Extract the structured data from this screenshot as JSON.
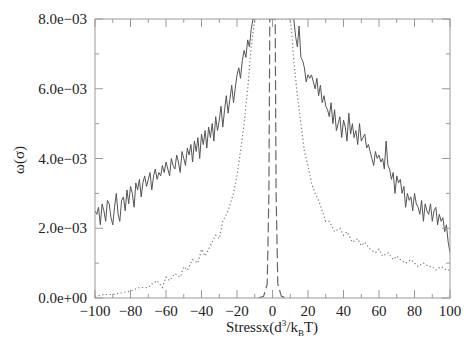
{
  "chart_data": {
    "type": "line",
    "title": "",
    "xlabel": "Stressx(d^3/k_B T)",
    "xlabel_parts": {
      "main": "Stressx(d",
      "sup": "3",
      "mid": "/k",
      "sub": "B",
      "end": "T)"
    },
    "ylabel": "ω(σ)",
    "xlim": [
      -100,
      100
    ],
    "ylim": [
      0,
      0.008
    ],
    "xticks": [
      -100,
      -80,
      -60,
      -40,
      -20,
      0,
      20,
      40,
      60,
      80,
      100
    ],
    "xtick_labels": [
      "−100",
      "−80",
      "−60",
      "−40",
      "−20",
      "0",
      "20",
      "40",
      "60",
      "80",
      "100"
    ],
    "yticks": [
      0,
      0.002,
      0.004,
      0.006,
      0.008
    ],
    "ytick_labels": [
      "0.0e+00",
      "2.0e−03",
      "4.0e−03",
      "6.0e−03",
      "8.0e−03"
    ],
    "grid": false,
    "legend": null,
    "series": [
      {
        "name": "solid",
        "style": "solid",
        "color": "#555555",
        "x": [
          -100,
          -99,
          -98,
          -97,
          -96,
          -95,
          -94,
          -93,
          -92,
          -91,
          -90,
          -89,
          -88,
          -87,
          -86,
          -85,
          -84,
          -83,
          -82,
          -81,
          -80,
          -79,
          -78,
          -77,
          -76,
          -75,
          -74,
          -73,
          -72,
          -71,
          -70,
          -69,
          -68,
          -67,
          -66,
          -65,
          -64,
          -63,
          -62,
          -61,
          -60,
          -59,
          -58,
          -57,
          -56,
          -55,
          -54,
          -53,
          -52,
          -51,
          -50,
          -49,
          -48,
          -47,
          -46,
          -45,
          -44,
          -43,
          -42,
          -41,
          -40,
          -39,
          -38,
          -37,
          -36,
          -35,
          -34,
          -33,
          -32,
          -31,
          -30,
          -29,
          -28,
          -27,
          -26,
          -25,
          -24,
          -23,
          -22,
          -21,
          -20,
          -19,
          -18,
          -17,
          -16,
          -15,
          -14,
          -13,
          -12,
          -11,
          -10
        ],
        "y": [
          0.0025,
          0.0024,
          0.0026,
          0.0021,
          0.0027,
          0.0025,
          0.0022,
          0.0028,
          0.0027,
          0.0023,
          0.0021,
          0.0026,
          0.003,
          0.0024,
          0.0022,
          0.0028,
          0.0029,
          0.0025,
          0.0031,
          0.0027,
          0.0032,
          0.003,
          0.0026,
          0.0033,
          0.0031,
          0.0034,
          0.0029,
          0.0033,
          0.0035,
          0.0032,
          0.0034,
          0.0036,
          0.0031,
          0.0035,
          0.0037,
          0.0034,
          0.0036,
          0.0035,
          0.0038,
          0.0036,
          0.0039,
          0.0037,
          0.0035,
          0.004,
          0.0038,
          0.0037,
          0.0041,
          0.0039,
          0.0036,
          0.0042,
          0.004,
          0.0038,
          0.0043,
          0.0041,
          0.0044,
          0.0039,
          0.0045,
          0.0042,
          0.0046,
          0.004,
          0.0047,
          0.0044,
          0.0048,
          0.0043,
          0.0049,
          0.0046,
          0.005,
          0.0045,
          0.0052,
          0.0048,
          0.0051,
          0.0055,
          0.0049,
          0.0054,
          0.0058,
          0.0053,
          0.0057,
          0.0061,
          0.0056,
          0.006,
          0.0064,
          0.0066,
          0.0063,
          0.0068,
          0.0071,
          0.0069,
          0.0074,
          0.0072,
          0.0077,
          0.008,
          0.008
        ]
      },
      {
        "name": "solid-right",
        "style": "solid",
        "color": "#555555",
        "x": [
          12,
          13,
          14,
          15,
          16,
          17,
          18,
          19,
          20,
          21,
          22,
          23,
          24,
          25,
          26,
          27,
          28,
          29,
          30,
          31,
          32,
          33,
          34,
          35,
          36,
          37,
          38,
          39,
          40,
          41,
          42,
          43,
          44,
          45,
          46,
          47,
          48,
          49,
          50,
          51,
          52,
          53,
          54,
          55,
          56,
          57,
          58,
          59,
          60,
          61,
          62,
          63,
          64,
          65,
          66,
          67,
          68,
          69,
          70,
          71,
          72,
          73,
          74,
          75,
          76,
          77,
          78,
          79,
          80,
          81,
          82,
          83,
          84,
          85,
          86,
          87,
          88,
          89,
          90,
          91,
          92,
          93,
          94,
          95,
          96,
          97,
          98,
          99,
          100
        ],
        "y": [
          0.008,
          0.0075,
          0.0072,
          0.0078,
          0.0069,
          0.0068,
          0.0066,
          0.0062,
          0.0064,
          0.0063,
          0.0064,
          0.0062,
          0.006,
          0.0063,
          0.0058,
          0.0061,
          0.0056,
          0.0058,
          0.0055,
          0.0054,
          0.0052,
          0.0056,
          0.005,
          0.0054,
          0.0048,
          0.005,
          0.0052,
          0.0046,
          0.0051,
          0.0049,
          0.0045,
          0.0053,
          0.0047,
          0.005,
          0.0046,
          0.0048,
          0.0044,
          0.005,
          0.0045,
          0.0046,
          0.0047,
          0.0043,
          0.0044,
          0.0042,
          0.004,
          0.0038,
          0.0042,
          0.004,
          0.0041,
          0.0039,
          0.004,
          0.0037,
          0.0045,
          0.0038,
          0.0037,
          0.0034,
          0.0036,
          0.003,
          0.0035,
          0.0033,
          0.0034,
          0.003,
          0.0032,
          0.0026,
          0.003,
          0.0028,
          0.0029,
          0.0025,
          0.003,
          0.0027,
          0.0026,
          0.0024,
          0.0028,
          0.0022,
          0.0027,
          0.0025,
          0.0024,
          0.0027,
          0.0022,
          0.0025,
          0.0026,
          0.0021,
          0.0024,
          0.0022,
          0.0023,
          0.0019,
          0.0021,
          0.0016,
          0.0013
        ]
      },
      {
        "name": "dotted",
        "style": "dotted",
        "color": "#777777",
        "x": [
          -100,
          -95,
          -90,
          -85,
          -80,
          -75,
          -70,
          -68,
          -65,
          -62,
          -60,
          -58,
          -55,
          -52,
          -50,
          -48,
          -45,
          -42,
          -40,
          -38,
          -35,
          -32,
          -30,
          -28,
          -25,
          -22,
          -20,
          -18,
          -16,
          -14,
          -12,
          -10,
          -9,
          -8,
          -7,
          -6,
          -5,
          -4,
          -3,
          -2,
          -1,
          0,
          1,
          2,
          3,
          4,
          5,
          6,
          7,
          8,
          9,
          10,
          11,
          12,
          14,
          16,
          18,
          20,
          22,
          24,
          26,
          28,
          30,
          32,
          35,
          38,
          40,
          42,
          45,
          48,
          50,
          52,
          55,
          58,
          60,
          62,
          65,
          68,
          70,
          72,
          75,
          78,
          80,
          82,
          85,
          88,
          90,
          92,
          95,
          98,
          100
        ],
        "y": [
          5e-05,
          0.0001,
          0.0001,
          0.00015,
          0.0002,
          0.0003,
          0.0003,
          0.0004,
          0.0005,
          0.0003,
          0.0006,
          0.0005,
          0.0007,
          0.0006,
          0.0009,
          0.0008,
          0.0011,
          0.001,
          0.0014,
          0.0012,
          0.0015,
          0.0018,
          0.0017,
          0.0022,
          0.0025,
          0.003,
          0.0035,
          0.0042,
          0.005,
          0.006,
          0.0072,
          0.008,
          0.008,
          0.008,
          0.008,
          0.008,
          0.008,
          0.008,
          0.008,
          0.008,
          0.008,
          0.008,
          0.008,
          0.008,
          0.008,
          0.008,
          0.008,
          0.008,
          0.008,
          0.008,
          0.008,
          0.008,
          0.0075,
          0.0068,
          0.0058,
          0.005,
          0.0042,
          0.0038,
          0.0033,
          0.003,
          0.0028,
          0.0025,
          0.0022,
          0.0022,
          0.0019,
          0.002,
          0.0018,
          0.0019,
          0.0016,
          0.0017,
          0.0015,
          0.0016,
          0.0014,
          0.0013,
          0.0014,
          0.0012,
          0.0013,
          0.0011,
          0.0012,
          0.0011,
          0.001,
          0.0011,
          0.001,
          0.0009,
          0.001,
          0.0009,
          0.0009,
          0.0008,
          0.0009,
          0.0008,
          0.0008
        ]
      },
      {
        "name": "dashed",
        "style": "dashed",
        "color": "#666666",
        "x": [
          -8,
          -5,
          -3,
          -2,
          -1.5,
          -1,
          0,
          1,
          1.5,
          2,
          3,
          5,
          8
        ],
        "y": [
          0.0,
          5e-05,
          0.0004,
          0.003,
          0.008,
          0.008,
          0.008,
          0.008,
          0.008,
          0.003,
          0.0004,
          5e-05,
          0.0
        ]
      }
    ]
  }
}
